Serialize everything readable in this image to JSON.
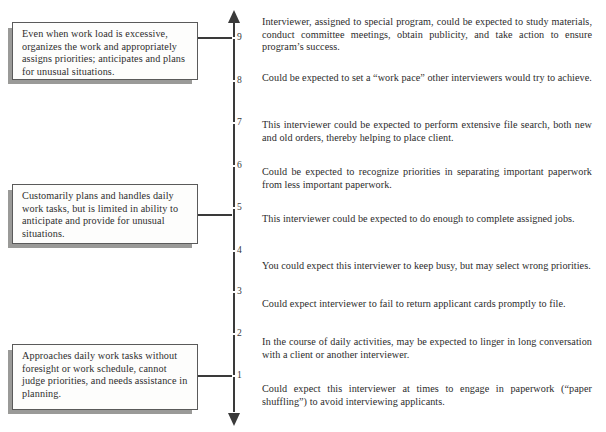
{
  "figure": {
    "scale": {
      "orientation": "vertical",
      "arrow_top": true,
      "arrow_bottom": true,
      "ticks": [
        {
          "label": "9",
          "value": 9,
          "y": 37
        },
        {
          "label": "8",
          "value": 8,
          "y": 80
        },
        {
          "label": "7",
          "value": 7,
          "y": 122
        },
        {
          "label": "6",
          "value": 6,
          "y": 165
        },
        {
          "label": "5",
          "value": 5,
          "y": 207
        },
        {
          "label": "4",
          "value": 4,
          "y": 250
        },
        {
          "label": "3",
          "value": 3,
          "y": 291
        },
        {
          "label": "2",
          "value": 2,
          "y": 333
        },
        {
          "label": "1",
          "value": 1,
          "y": 375
        }
      ]
    },
    "anchors": [
      {
        "id": "anchor-high",
        "anchored_value": 9,
        "text": "Even when work load is excessive, organizes the work and appropriately assigns priorities; anticipates and plans for unusual situations."
      },
      {
        "id": "anchor-middle",
        "anchored_value": 5,
        "text": "Customarily plans and handles daily work tasks, but is limited in ability to anticipate and provide for unusual situations."
      },
      {
        "id": "anchor-low",
        "anchored_value": 1,
        "text": "Approaches daily work tasks without foresight or work schedule, cannot judge priorities, and needs assistance in planning."
      }
    ],
    "behavioral_examples": [
      {
        "index": 1,
        "text": "Interviewer, assigned to special program, could be expected to study materials, conduct committee meetings, obtain publicity, and take action to ensure program’s success."
      },
      {
        "index": 2,
        "text": "Could be expected to set a “work pace” other interviewers would try to achieve."
      },
      {
        "index": 3,
        "text": "This interviewer could be expected to perform extensive file search, both new and old orders, thereby helping to place client."
      },
      {
        "index": 4,
        "text": "Could be expected to recognize priorities in separating important paperwork from less important paperwork."
      },
      {
        "index": 5,
        "text": "This interviewer could be expected to do enough to complete assigned jobs."
      },
      {
        "index": 6,
        "text": "You could expect this interviewer to keep busy, but may select wrong priorities."
      },
      {
        "index": 7,
        "text": "Could expect interviewer to fail to return applicant cards promptly to file."
      },
      {
        "index": 8,
        "text": "In the course of daily activities, may be expected to linger in long conversation with a client or another interviewer."
      },
      {
        "index": 9,
        "text": "Could expect this interviewer at times to engage in paperwork (“paper shuffling”) to avoid interviewing applicants."
      }
    ],
    "colors": {
      "page_background": "#ffffff",
      "text": "#2c2c2c",
      "box_border": "#5a5a5a",
      "box_fill": "#fdfdfc",
      "box_shadow": "#9a9a98",
      "axis": "#3a3a3a"
    }
  }
}
